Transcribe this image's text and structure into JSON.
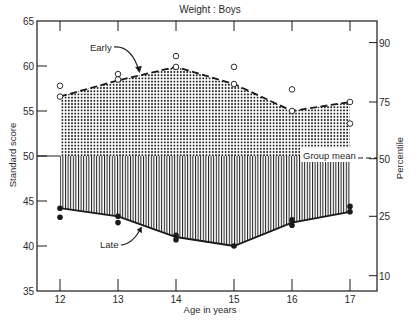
{
  "chart_data": {
    "type": "area",
    "title": "Weight : Boys",
    "xlabel": "Age in years",
    "ylabel": "Standard score",
    "y2label": "Percentile",
    "x": [
      12,
      13,
      14,
      15,
      16,
      17
    ],
    "xlim": [
      11.6,
      17.5
    ],
    "ylim": [
      35,
      65
    ],
    "yticks": [
      35,
      40,
      45,
      50,
      55,
      60,
      65
    ],
    "y2ticks": [
      {
        "label": "90",
        "y": 62.6
      },
      {
        "label": "75",
        "y": 56.0
      },
      {
        "label": "50",
        "y": 49.7
      },
      {
        "label": "25",
        "y": 43.3
      },
      {
        "label": "10",
        "y": 36.7
      }
    ],
    "grid": false,
    "group_mean": 50,
    "series": [
      {
        "name": "Early",
        "style": "dashed line, dotted fill above mean",
        "values": [
          56.6,
          58.4,
          59.9,
          58.0,
          55.0,
          56.0
        ]
      },
      {
        "name": "Late",
        "style": "solid line, vertical-hatched fill below mean",
        "values": [
          44.2,
          43.3,
          41.0,
          40.0,
          42.6,
          43.8
        ]
      }
    ],
    "points": {
      "early_open_circles": [
        {
          "x": 12,
          "y": 57.8
        },
        {
          "x": 12,
          "y": 56.6
        },
        {
          "x": 13,
          "y": 59.1
        },
        {
          "x": 13,
          "y": 58.5
        },
        {
          "x": 14,
          "y": 61.1
        },
        {
          "x": 14,
          "y": 59.9
        },
        {
          "x": 15,
          "y": 59.9
        },
        {
          "x": 15,
          "y": 58.0
        },
        {
          "x": 16,
          "y": 57.4
        },
        {
          "x": 16,
          "y": 55.0
        },
        {
          "x": 17,
          "y": 56.0
        },
        {
          "x": 17,
          "y": 53.6
        }
      ],
      "late_filled_dots": [
        {
          "x": 12,
          "y": 44.2
        },
        {
          "x": 12,
          "y": 43.2
        },
        {
          "x": 13,
          "y": 43.3
        },
        {
          "x": 13,
          "y": 42.6
        },
        {
          "x": 14,
          "y": 41.2
        },
        {
          "x": 14,
          "y": 40.7
        },
        {
          "x": 15,
          "y": 40.0
        },
        {
          "x": 16,
          "y": 42.9
        },
        {
          "x": 16,
          "y": 42.3
        },
        {
          "x": 17,
          "y": 44.4
        },
        {
          "x": 17,
          "y": 43.8
        }
      ]
    },
    "annotations": [
      {
        "text": "Early",
        "target": "Early curve"
      },
      {
        "text": "Late",
        "target": "Late curve"
      },
      {
        "text": "Group mean",
        "target": "50th percentile line"
      }
    ]
  },
  "labels": {
    "title": "Weight : Boys",
    "xlabel": "Age in years",
    "ylabel": "Standard score",
    "y2label": "Percentile",
    "early": "Early",
    "late": "Late",
    "group_mean": "Group mean"
  },
  "colors": {
    "ink": "#1a1a1a",
    "background": "#ffffff"
  }
}
